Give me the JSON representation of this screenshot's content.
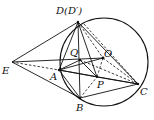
{
  "figure": {
    "type": "geometry-diagram",
    "circle": {
      "center": [
        104,
        62
      ],
      "radius": 44
    },
    "points": {
      "D": {
        "label": "D(D′)",
        "xy": [
          78,
          22
        ]
      },
      "Q": {
        "label": "Q",
        "xy": [
          80,
          60
        ]
      },
      "O": {
        "label": "O",
        "xy": [
          103,
          58
        ]
      },
      "E": {
        "label": "E",
        "xy": [
          12,
          62
        ]
      },
      "A": {
        "label": "A",
        "xy": [
          59,
          70
        ]
      },
      "P": {
        "label": "P",
        "xy": [
          97,
          77
        ]
      },
      "B": {
        "label": "B",
        "xy": [
          80,
          98
        ]
      },
      "C": {
        "label": "C",
        "xy": [
          138,
          84
        ]
      }
    },
    "solid_segments": [
      [
        "E",
        "D"
      ],
      [
        "E",
        "O"
      ],
      [
        "E",
        "B"
      ],
      [
        "D",
        "A"
      ],
      [
        "D",
        "B"
      ],
      [
        "D",
        "C"
      ],
      [
        "D",
        "P"
      ],
      [
        "A",
        "B"
      ],
      [
        "A",
        "C"
      ],
      [
        "A",
        "O"
      ],
      [
        "B",
        "C"
      ],
      [
        "Q",
        "A"
      ],
      [
        "Q",
        "P"
      ],
      [
        "B",
        "P"
      ],
      [
        "A",
        "P"
      ]
    ],
    "dashed_segments": [
      [
        "E",
        "A"
      ],
      [
        "D",
        "O"
      ],
      [
        "O",
        "C"
      ],
      [
        "Q",
        "C"
      ],
      [
        "B",
        "P"
      ],
      [
        "O",
        "P"
      ]
    ]
  }
}
